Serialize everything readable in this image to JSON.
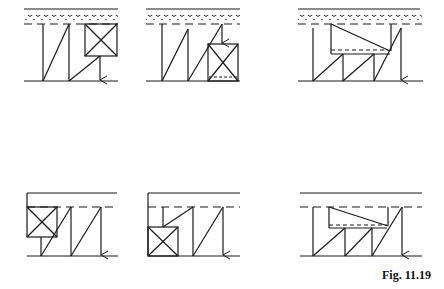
{
  "figure": {
    "caption": "Fig. 11.19",
    "stroke_color": "#1a1a1a",
    "panels": [
      {
        "id": "top-left",
        "row": 1,
        "col": 1,
        "ground_surface": "wavy",
        "element": "square-box",
        "box_position": "upper-right",
        "arrow": "down-to-bottom"
      },
      {
        "id": "top-middle",
        "row": 1,
        "col": 2,
        "ground_surface": "wavy",
        "element": "square-box",
        "box_position": "lower-right",
        "arrow": "down-to-box"
      },
      {
        "id": "top-right",
        "row": 1,
        "col": 3,
        "ground_surface": "wavy",
        "element": "trapezoid-block",
        "box_position": "upper-middle",
        "arrow": "down-to-bottom"
      },
      {
        "id": "bottom-left",
        "row": 2,
        "col": 1,
        "ground_surface": "solid",
        "element": "square-box",
        "box_position": "upper-left",
        "arrow": "down-to-bottom"
      },
      {
        "id": "bottom-middle",
        "row": 2,
        "col": 2,
        "ground_surface": "solid",
        "element": "square-box",
        "box_position": "lower-left",
        "arrow": "down-to-bottom"
      },
      {
        "id": "bottom-right",
        "row": 2,
        "col": 3,
        "ground_surface": "solid",
        "element": "trapezoid-block",
        "box_position": "upper-middle",
        "arrow": "down-to-bottom"
      }
    ]
  }
}
